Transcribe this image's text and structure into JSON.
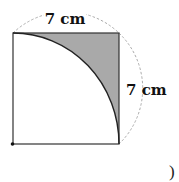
{
  "figure": {
    "top_label": "7 cm",
    "right_label": "7 cm",
    "trailing_text": ")",
    "shade_color": "#a9a9a9",
    "line_color": "#222222",
    "dash_color": "#9a9a9a"
  }
}
